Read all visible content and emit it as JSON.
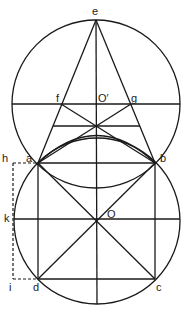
{
  "diagram": {
    "title": "",
    "labels": {
      "e": "e",
      "f": "f",
      "o_prime": "O′",
      "g": "g",
      "h": "h",
      "a": "a",
      "b": "b",
      "k": "k",
      "o": "O",
      "i": "i",
      "d": "d",
      "c": "c"
    },
    "points": {
      "e": [
        96,
        20
      ],
      "o_prime": [
        96,
        104
      ],
      "f": [
        61,
        104
      ],
      "g": [
        131,
        104
      ],
      "a": [
        38,
        163
      ],
      "b": [
        155,
        163
      ],
      "c": [
        155,
        279
      ],
      "d": [
        38,
        279
      ],
      "o": [
        97,
        221
      ],
      "k": [
        14,
        219
      ],
      "h": [
        13,
        163
      ],
      "i": [
        13,
        279
      ],
      "x_cross": [
        97,
        125
      ]
    },
    "circles": [
      {
        "name": "upper-circle",
        "cx": 96,
        "cy": 104,
        "r": 84
      },
      {
        "name": "lower-circle",
        "cx": 97,
        "cy": 221,
        "r": 83
      }
    ],
    "colors": {
      "stroke": "#1a1a1a",
      "background": "#ffffff"
    }
  }
}
